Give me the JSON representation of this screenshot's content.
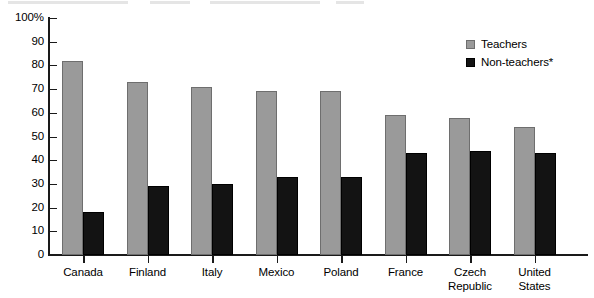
{
  "chart_data": {
    "type": "bar",
    "title": "",
    "subtitle": "",
    "xlabel": "",
    "ylabel": "",
    "ylim": [
      0,
      100
    ],
    "y_ticks": [
      "0",
      "10",
      "20",
      "30",
      "40",
      "50",
      "60",
      "70",
      "80",
      "90",
      "100%"
    ],
    "y_tick_values": [
      0,
      10,
      20,
      30,
      40,
      50,
      60,
      70,
      80,
      90,
      100
    ],
    "grid": false,
    "legend_position": "top-right",
    "categories": [
      "Canada",
      "Finland",
      "Italy",
      "Mexico",
      "Poland",
      "France",
      "Czech Republic",
      "United States"
    ],
    "series": [
      {
        "name": "Teachers",
        "color": "#9a9a9a",
        "values": [
          82,
          73,
          71,
          69,
          69,
          59,
          58,
          54
        ]
      },
      {
        "name": "Non-teachers*",
        "color": "#131313",
        "values": [
          18,
          29,
          30,
          33,
          33,
          43,
          44,
          43
        ]
      }
    ],
    "annotations": []
  },
  "legend": {
    "items": [
      {
        "label": "Teachers",
        "swatch": "teachers-swatch"
      },
      {
        "label": "Non-teachers*",
        "swatch": "non-teachers-swatch"
      }
    ]
  },
  "axis": {
    "y_top_label": "100%",
    "baseline_label": "0"
  }
}
